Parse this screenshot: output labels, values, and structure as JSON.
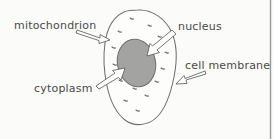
{
  "diagram": {
    "background_color": "#fbfbfa",
    "ink_color": "#5d5d5b",
    "labels": {
      "mitochondrion": "mitochondrion",
      "nucleus": "nucleus",
      "cell_membrane": "cell membrane",
      "cytoplasm": "cytoplasm"
    },
    "parts": {
      "cell_body_name": "cell-body",
      "nucleus_name": "nucleus-shape",
      "nucleus_fill": "#a3a3a1",
      "mitochondria_count": 14
    },
    "arrows": {
      "mitochondrion_direction": "right-down",
      "nucleus_direction": "left-down",
      "cell_membrane_direction": "left-down",
      "cytoplasm_direction": "right-up"
    }
  }
}
